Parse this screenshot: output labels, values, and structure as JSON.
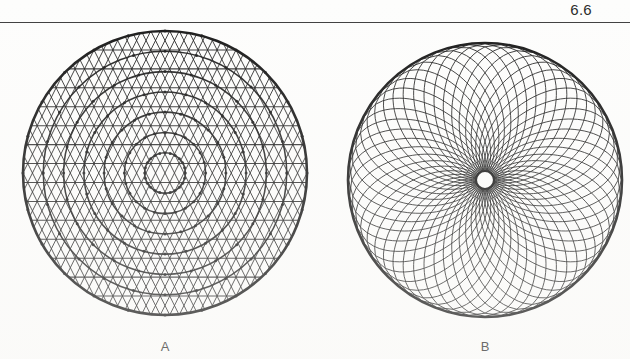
{
  "page": {
    "number": "6.6",
    "rule_visible": true,
    "background_color": "#fdfdfc",
    "ink_color": "#1a1a1a"
  },
  "figure": {
    "caption_a": "A",
    "caption_b": "B",
    "panels": [
      {
        "id": "A",
        "label": "A",
        "description": "circular triangulated concentric mesh",
        "center_x": 165,
        "center_y": 149,
        "radius": 142,
        "ring_count": 7,
        "sector_count": 24,
        "pattern": "concentric-rings-with-horizontal-chords-and-diagonal-bracing"
      },
      {
        "id": "B",
        "label": "B",
        "description": "circular spirograph rose of curved spokes from a small hub",
        "center_x": 485,
        "center_y": 156,
        "radius": 137,
        "hub_radius": 9,
        "spoke_count": 52,
        "pattern": "logarithmic-spiral-arcs-clockwise-and-counterclockwise"
      }
    ]
  },
  "chart_data": {
    "type": "diagram",
    "title": "6.6",
    "panels": [
      {
        "name": "A",
        "type": "polar-mesh",
        "rings": [
          20.3,
          40.6,
          60.9,
          81.1,
          101.4,
          121.7,
          142
        ],
        "horizontal_chord_rows": 15,
        "nodes_per_ring": 24
      },
      {
        "name": "B",
        "type": "spiral-rose",
        "arcs": 52,
        "inner_radius": 9,
        "outer_radius": 137,
        "turn_degrees": 115
      }
    ]
  }
}
